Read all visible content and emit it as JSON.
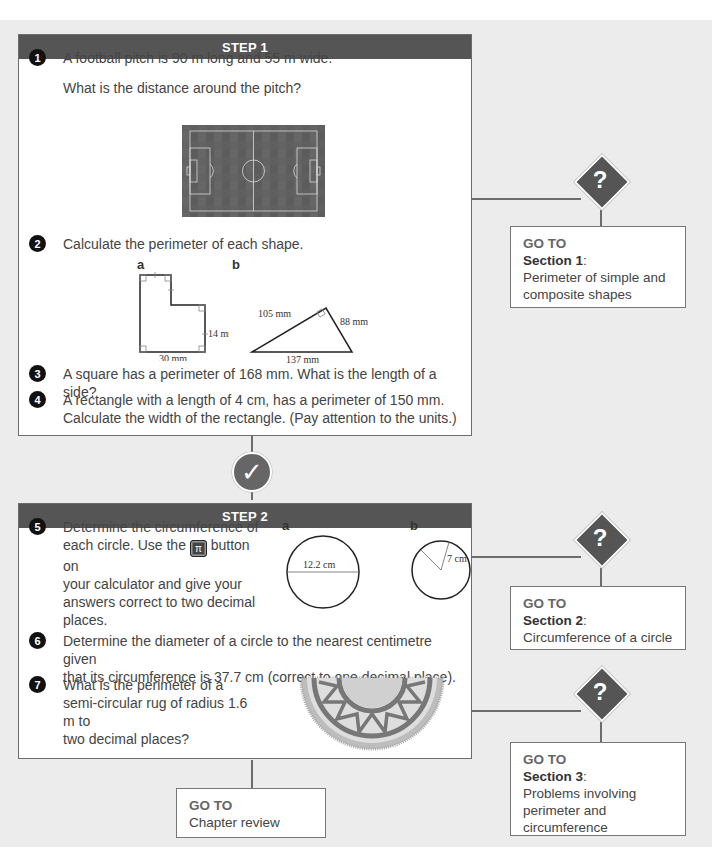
{
  "step1": {
    "header": "STEP 1",
    "questions": [
      {
        "num": "1",
        "line1": "A football pitch is 90 m long and 55 m wide.",
        "line2": "What is the distance around the pitch?"
      },
      {
        "num": "2",
        "text": "Calculate the perimeter of each shape.",
        "shape_a": {
          "label": "a",
          "dim_right": "14 mm",
          "dim_bottom": "30 mm"
        },
        "shape_b": {
          "label": "b",
          "side_left": "105 mm",
          "side_right": "88 mm",
          "side_bottom": "137 mm"
        }
      },
      {
        "num": "3",
        "text": "A square has a perimeter of 168 mm. What is the length of a side?"
      },
      {
        "num": "4",
        "line1": "A rectangle with a length of 4 cm, has a perimeter of 150 mm.",
        "line2": "Calculate the width of the rectangle. (Pay attention to the units.)"
      }
    ]
  },
  "step2": {
    "header": "STEP 2",
    "questions": [
      {
        "num": "5",
        "line1": "Determine the circumference of",
        "line2a": "each circle. Use the",
        "key": "π",
        "line2b": "button on",
        "line3": "your calculator and give your",
        "line4": "answers correct to two decimal",
        "line5": "places.",
        "circle_a": {
          "label": "a",
          "diameter": "12.2 cm"
        },
        "circle_b": {
          "label": "b",
          "radius": "7 cm"
        }
      },
      {
        "num": "6",
        "line1": "Determine the diameter of a circle to the nearest centimetre given",
        "line2": "that its circumference is 37.7 cm (correct to one decimal place)."
      },
      {
        "num": "7",
        "line1": "What is the perimeter of a",
        "line2": "semi-circular rug of radius 1.6 m to",
        "line3": "two decimal places?"
      }
    ]
  },
  "help_icon": "?",
  "check_icon": "✓",
  "goto_boxes": [
    {
      "label": "GO TO",
      "section": "Section 1",
      "colon": ":",
      "line1": "Perimeter of simple and",
      "line2": "composite shapes"
    },
    {
      "label": "GO TO",
      "section": "Section 2",
      "colon": ":",
      "line1": "Circumference of a circle"
    },
    {
      "label": "GO TO",
      "section": "Section 3",
      "colon": ":",
      "line1": "Problems involving",
      "line2": "perimeter and",
      "line3": "circumference"
    }
  ],
  "chapter_review": {
    "label": "GO TO",
    "text": "Chapter review"
  },
  "colors": {
    "header": "#555555",
    "background": "#ececec",
    "line": "#6c6c6c"
  }
}
